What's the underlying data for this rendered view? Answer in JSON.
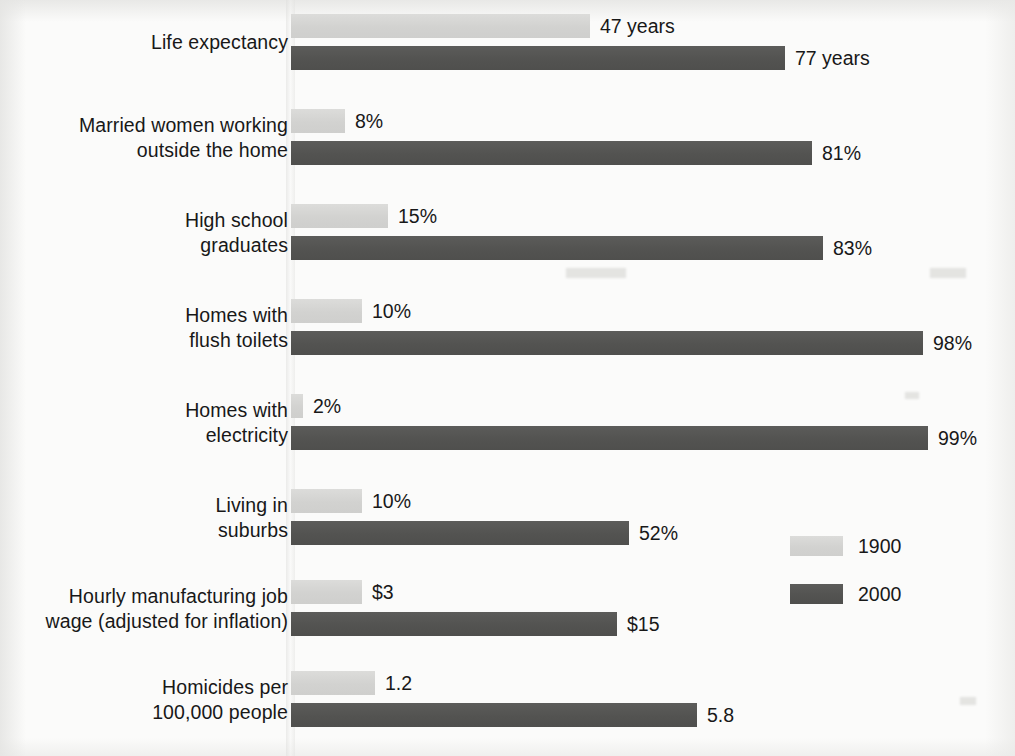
{
  "chart_data": {
    "type": "bar",
    "orientation": "horizontal",
    "title": "",
    "xlabel": "",
    "ylabel": "",
    "grid": false,
    "legend_position": "right-lower",
    "note": "Each category uses its own horizontal scale; bar labels state exact values.",
    "categories": [
      "Life expectancy",
      "Married women working outside the home",
      "High school graduates",
      "Homes with flush toilets",
      "Homes with electricity",
      "Living in suburbs",
      "Hourly manufacturing job wage (adjusted for inflation)",
      "Homicides per 100,000 people"
    ],
    "series": [
      {
        "name": "1900",
        "color": "#d4d4d2",
        "values": [
          47,
          8,
          15,
          10,
          2,
          10,
          3,
          1.2
        ],
        "value_labels": [
          "47 years",
          "8%",
          "15%",
          "10%",
          "2%",
          "10%",
          "$3",
          "1.2"
        ]
      },
      {
        "name": "2000",
        "color": "#555553",
        "values": [
          77,
          81,
          83,
          98,
          99,
          52,
          15,
          5.8
        ],
        "value_labels": [
          "77 years",
          "81%",
          "83%",
          "98%",
          "99%",
          "52%",
          "$15",
          "5.8"
        ]
      }
    ]
  },
  "rows": [
    {
      "label": "Life expectancy",
      "label_lines": "Life expectancy",
      "top": 14,
      "light": {
        "value_label": "47 years",
        "width": 299
      },
      "dark": {
        "value_label": "77 years",
        "width": 494
      }
    },
    {
      "label": "Married women working outside the home",
      "label_lines": "Married women working\noutside the home",
      "top": 109,
      "light": {
        "value_label": "8%",
        "width": 54
      },
      "dark": {
        "value_label": "81%",
        "width": 521
      }
    },
    {
      "label": "High school graduates",
      "label_lines": "High school\ngraduates",
      "top": 204,
      "light": {
        "value_label": "15%",
        "width": 97
      },
      "dark": {
        "value_label": "83%",
        "width": 532
      }
    },
    {
      "label": "Homes with flush toilets",
      "label_lines": "Homes with\nflush toilets",
      "top": 299,
      "light": {
        "value_label": "10%",
        "width": 71
      },
      "dark": {
        "value_label": "98%",
        "width": 632
      }
    },
    {
      "label": "Homes with electricity",
      "label_lines": "Homes with\nelectricity",
      "top": 394,
      "light": {
        "value_label": "2%",
        "width": 12
      },
      "dark": {
        "value_label": "99%",
        "width": 637
      }
    },
    {
      "label": "Living in suburbs",
      "label_lines": "Living in\nsuburbs",
      "top": 489,
      "light": {
        "value_label": "10%",
        "width": 71
      },
      "dark": {
        "value_label": "52%",
        "width": 338
      }
    },
    {
      "label": "Hourly manufacturing job wage (adjusted for inflation)",
      "label_lines": "Hourly manufacturing job\nwage (adjusted for inflation)",
      "top": 580,
      "light": {
        "value_label": "$3",
        "width": 71
      },
      "dark": {
        "value_label": "$15",
        "width": 326
      }
    },
    {
      "label": "Homicides per 100,000 people",
      "label_lines": "Homicides per\n100,000 people",
      "top": 671,
      "light": {
        "value_label": "1.2",
        "width": 84
      },
      "dark": {
        "value_label": "5.8",
        "width": 406
      }
    }
  ],
  "legend": {
    "items": [
      {
        "label": "1900",
        "color": "#d4d4d2",
        "top": 6
      },
      {
        "label": "2000",
        "color": "#555553",
        "top": 54
      }
    ]
  }
}
